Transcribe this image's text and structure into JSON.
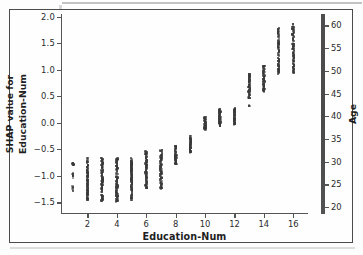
{
  "chart_data": {
    "type": "scatter",
    "title": "",
    "xlabel": "Education-Num",
    "ylabel_line1": "SHAP value for",
    "ylabel_line2": "Education-Num",
    "xlim": [
      0.2,
      17.0
    ],
    "ylim": [
      -1.72,
      2.05
    ],
    "grid": false,
    "legend": "none",
    "xticks": [
      2,
      4,
      6,
      8,
      10,
      12,
      14,
      16
    ],
    "xtick_labels": [
      "2",
      "4",
      "6",
      "8",
      "10",
      "12",
      "14",
      "16"
    ],
    "yticks": [
      2.0,
      1.5,
      1.0,
      0.5,
      0.0,
      -0.5,
      -1.0,
      -1.5
    ],
    "ytick_labels": [
      "2.0",
      "1.5",
      "1.0",
      "0.5",
      "0.0",
      "-0.5",
      "-1.0",
      "-1.5"
    ],
    "colorbar": {
      "label": "Age",
      "ticks": [
        20,
        25,
        30,
        35,
        40,
        45,
        50,
        55,
        60
      ],
      "tick_labels": [
        "20",
        "25",
        "30",
        "35",
        "40",
        "45",
        "50",
        "55",
        "60"
      ],
      "vmin": 18.5,
      "vmax": 62.5,
      "orientation": "vertical",
      "position": "right"
    },
    "point_color": "#3a3a3a",
    "point_size": 2.1,
    "series": [
      {
        "name": "SHAP value for Education-Num vs Education-Num (colored by Age)",
        "groups": [
          {
            "x": 1,
            "y_min": -1.42,
            "y_max": -0.73,
            "count": 26,
            "bands": [
              [
                -0.8,
                -0.73
              ],
              [
                -1.05,
                -0.95
              ],
              [
                -1.3,
                -1.2
              ],
              [
                -1.42,
                -1.37
              ]
            ]
          },
          {
            "x": 2,
            "y_min": -1.46,
            "y_max": -0.66,
            "count": 120,
            "bands": [
              [
                -1.46,
                -0.66
              ]
            ]
          },
          {
            "x": 3,
            "y_min": -1.48,
            "y_max": -0.66,
            "count": 120,
            "bands": [
              [
                -1.48,
                -0.66
              ]
            ]
          },
          {
            "x": 4,
            "y_min": -1.49,
            "y_max": -0.67,
            "count": 120,
            "bands": [
              [
                -1.49,
                -0.67
              ]
            ]
          },
          {
            "x": 5,
            "y_min": -1.46,
            "y_max": -0.66,
            "count": 130,
            "bands": [
              [
                -1.46,
                -0.66
              ]
            ]
          },
          {
            "x": 6,
            "y_min": -1.24,
            "y_max": -0.54,
            "count": 110,
            "bands": [
              [
                -1.24,
                -0.54
              ]
            ]
          },
          {
            "x": 7,
            "y_min": -1.25,
            "y_max": -0.52,
            "count": 110,
            "bands": [
              [
                -1.25,
                -0.52
              ]
            ]
          },
          {
            "x": 8,
            "y_min": -0.79,
            "y_max": -0.4,
            "count": 70,
            "bands": [
              [
                -0.79,
                -0.4
              ]
            ]
          },
          {
            "x": 9,
            "y_min": -0.57,
            "y_max": -0.24,
            "count": 70,
            "bands": [
              [
                -0.57,
                -0.24
              ]
            ]
          },
          {
            "x": 10,
            "y_min": -0.14,
            "y_max": 0.11,
            "count": 65,
            "bands": [
              [
                -0.14,
                0.11
              ]
            ]
          },
          {
            "x": 11,
            "y_min": -0.06,
            "y_max": 0.27,
            "count": 70,
            "bands": [
              [
                -0.06,
                0.27
              ]
            ]
          },
          {
            "x": 12,
            "y_min": -0.04,
            "y_max": 0.27,
            "count": 70,
            "bands": [
              [
                -0.04,
                0.27
              ]
            ]
          },
          {
            "x": 13,
            "y_min": 0.31,
            "y_max": 0.93,
            "count": 80,
            "bands": [
              [
                0.46,
                0.93
              ],
              [
                0.31,
                0.33
              ]
            ]
          },
          {
            "x": 14,
            "y_min": 0.58,
            "y_max": 1.08,
            "count": 75,
            "bands": [
              [
                0.58,
                1.08
              ]
            ]
          },
          {
            "x": 15,
            "y_min": 0.92,
            "y_max": 1.8,
            "count": 100,
            "bands": [
              [
                0.92,
                1.8
              ]
            ]
          },
          {
            "x": 16,
            "y_min": 0.93,
            "y_max": 1.87,
            "count": 105,
            "bands": [
              [
                0.93,
                1.87
              ]
            ]
          }
        ]
      }
    ]
  }
}
